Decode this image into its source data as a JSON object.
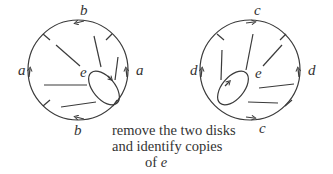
{
  "diagram": {
    "left_disk": {
      "labels": {
        "top": "b",
        "bottom": "b",
        "left": "a",
        "right": "a",
        "center": "e"
      }
    },
    "right_disk": {
      "labels": {
        "top": "c",
        "bottom": "c",
        "left": "d",
        "right": "d",
        "center": "e"
      }
    },
    "caption": {
      "line1": "remove the two disks",
      "line2": "and identify copies",
      "line3_prefix": "of ",
      "line3_var": "e"
    },
    "colors": {
      "stroke": "#3a3a3a",
      "text": "#333333"
    }
  }
}
